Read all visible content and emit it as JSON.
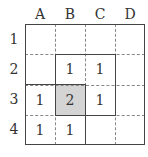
{
  "columns": [
    "A",
    "B",
    "C",
    "D"
  ],
  "rows": [
    "1",
    "2",
    "3",
    "4"
  ],
  "cells": {
    "B2": "1",
    "C2": "1",
    "A3": "1",
    "B3": "2",
    "C3": "1",
    "A4": "1",
    "B4": "1"
  },
  "shaded_cell": "B3",
  "colors": {
    "shade": "#d4d4d4",
    "line": "#444444",
    "dashed": "#888888"
  }
}
